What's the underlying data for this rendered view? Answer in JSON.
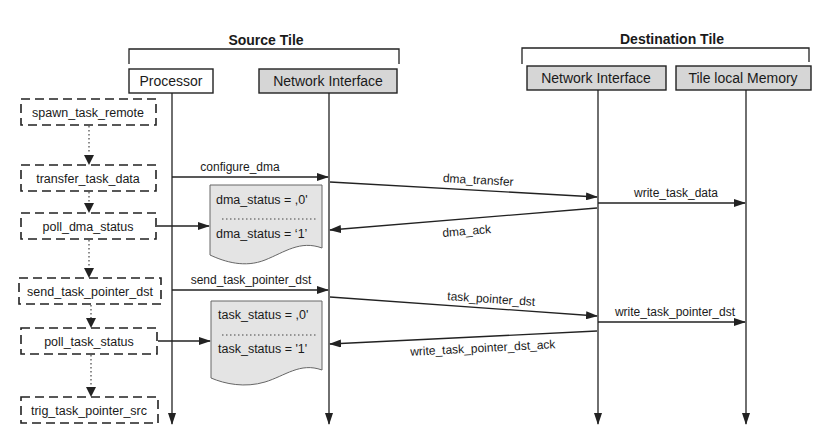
{
  "groups": [
    {
      "id": "source_tile",
      "title": "Source Tile"
    },
    {
      "id": "destination_tile",
      "title": "Destination Tile"
    }
  ],
  "participants": [
    {
      "id": "processor",
      "label": "Processor",
      "fill": "#ffffff"
    },
    {
      "id": "src_ni",
      "label": "Network Interface",
      "fill": "#d6d6d6"
    },
    {
      "id": "dst_ni",
      "label": "Network Interface",
      "fill": "#d6d6d6"
    },
    {
      "id": "mem",
      "label": "Tile local Memory",
      "fill": "#d6d6d6"
    }
  ],
  "steps": [
    {
      "label": "spawn_task_remote"
    },
    {
      "label": "transfer_task_data"
    },
    {
      "label": "poll_dma_status"
    },
    {
      "label": "send_task_pointer_dst"
    },
    {
      "label": "poll_task_status"
    },
    {
      "label": "trig_task_pointer_src"
    }
  ],
  "messages": [
    {
      "label": "configure_dma",
      "from": "processor",
      "to": "src_ni"
    },
    {
      "label": "dma_transfer",
      "from": "src_ni",
      "to": "dst_ni"
    },
    {
      "label": "write_task_data",
      "from": "dst_ni",
      "to": "mem"
    },
    {
      "label": "dma_ack",
      "from": "dst_ni",
      "to": "src_ni"
    },
    {
      "label": "send_task_pointer_dst",
      "from": "processor",
      "to": "src_ni"
    },
    {
      "label": "task_pointer_dst",
      "from": "src_ni",
      "to": "dst_ni"
    },
    {
      "label": "write_task_pointer_dst",
      "from": "dst_ni",
      "to": "mem"
    },
    {
      "label": "write_task_pointer_dst_ack",
      "from": "dst_ni",
      "to": "src_ni"
    }
  ],
  "notes": [
    {
      "line1": "dma_status = ,0'",
      "line2": "dma_status = ‘1’"
    },
    {
      "line1": "task_status = ,0'",
      "line2": "task_status = '1'"
    }
  ],
  "colors": {
    "ink": "#222222",
    "participant_shaded": "#d6d6d6",
    "note_fill": "#e4e4e4"
  }
}
